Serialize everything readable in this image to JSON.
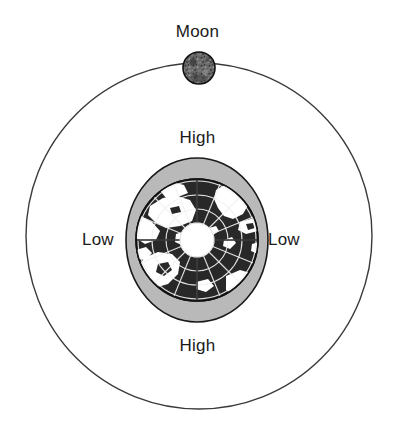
{
  "diagram": {
    "title_hidden": "",
    "background_color": "#ffffff",
    "labels": {
      "moon": "Moon",
      "high_top": "High",
      "high_bottom": "High",
      "low_left": "Low",
      "low_right": "Low"
    },
    "colors": {
      "orbit_stroke": "#3a3a3a",
      "moon_fill": "#6e6e6e",
      "moon_stroke": "#111111",
      "bulge_fill": "#b9b9b9",
      "bulge_stroke": "#1a1a1a",
      "ocean_fill": "#2b2b2b",
      "land_fill": "#ffffff",
      "graticule_stroke": "#f2f2f2",
      "polar_cap_fill": "#ffffff",
      "label_text": "#1a1a1a"
    },
    "geometry": {
      "canvas_width": 395,
      "canvas_height": 442,
      "orbit_center_x": 199,
      "orbit_center_y": 236,
      "orbit_radius": 173,
      "moon_center_x": 199,
      "moon_center_y": 68,
      "moon_radius": 16,
      "earth_center_x": 197,
      "earth_center_y": 240,
      "bulge_rx": 71,
      "bulge_ry": 82,
      "earth_radius": 61,
      "polar_cap_radius": 17
    },
    "annotations": [
      {
        "name": "moon",
        "text": "Moon",
        "position": "top"
      },
      {
        "name": "high-tide-near",
        "text": "High",
        "position": "earth-top"
      },
      {
        "name": "high-tide-far",
        "text": "High",
        "position": "earth-bottom"
      },
      {
        "name": "low-tide-west",
        "text": "Low",
        "position": "earth-left"
      },
      {
        "name": "low-tide-east",
        "text": "Low",
        "position": "earth-right"
      }
    ]
  }
}
